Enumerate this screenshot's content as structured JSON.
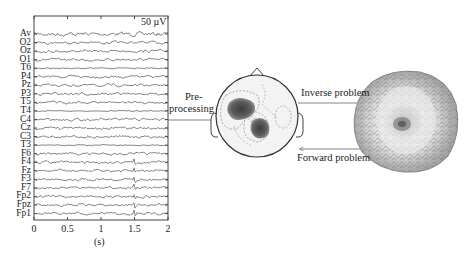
{
  "eeg": {
    "channels": [
      "Av",
      "O2",
      "Oz",
      "O1",
      "T6",
      "P4",
      "Pz",
      "P3",
      "T5",
      "T4",
      "C4",
      "Cz",
      "C3",
      "T3",
      "F6",
      "F4",
      "Fz",
      "F3",
      "F7",
      "Fp2",
      "Fpz",
      "Fp1"
    ],
    "scale_label": "50 µV",
    "x_ticks": [
      "0",
      "0.5",
      "1",
      "1.5",
      "2"
    ],
    "x_tick_values": [
      0,
      0.5,
      1,
      1.5,
      2
    ],
    "x_label": "(s)",
    "x_range": [
      0,
      2
    ]
  },
  "steps": {
    "preprocessing_line1": "Pre-",
    "preprocessing_line2": "processing",
    "inverse_label": "Inverse problem",
    "forward_label": "Forward problem"
  },
  "scalp_map": {
    "name": "scalp-topography"
  },
  "cortex": {
    "name": "cortical-source-image"
  },
  "colors": {
    "line": "#4a4a4a",
    "trace": "#555555",
    "blob": "#5a5a5a"
  }
}
